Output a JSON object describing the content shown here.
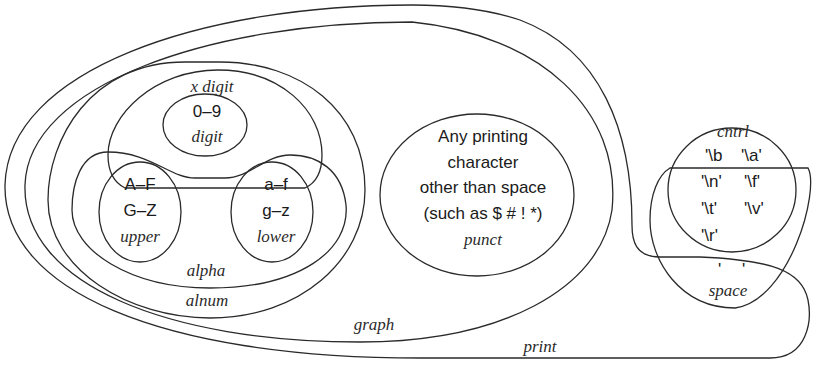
{
  "diagram": {
    "type": "venn",
    "sets": {
      "print": {
        "label": "print"
      },
      "graph": {
        "label": "graph"
      },
      "alnum": {
        "label": "alnum"
      },
      "alpha": {
        "label": "alpha"
      },
      "xdigit": {
        "label": "x digit"
      },
      "digit": {
        "label": "digit",
        "contents": "0–9"
      },
      "upper": {
        "label": "upper",
        "hex_range": "A–F",
        "range": "G–Z"
      },
      "lower": {
        "label": "lower",
        "hex_range": "a–f",
        "range": "g–z"
      },
      "punct": {
        "label": "punct",
        "lines": [
          "Any printing",
          "character",
          "other than space",
          "(such as $ # ! *)"
        ]
      },
      "cntrl": {
        "label": "cntrl",
        "items": [
          "'\\b",
          "'\\a'",
          "'\\n'",
          "'\\f'",
          "'\\t'",
          "'\\v'",
          "'\\r'"
        ]
      },
      "space": {
        "label": "space",
        "space_char": "' '"
      }
    }
  }
}
